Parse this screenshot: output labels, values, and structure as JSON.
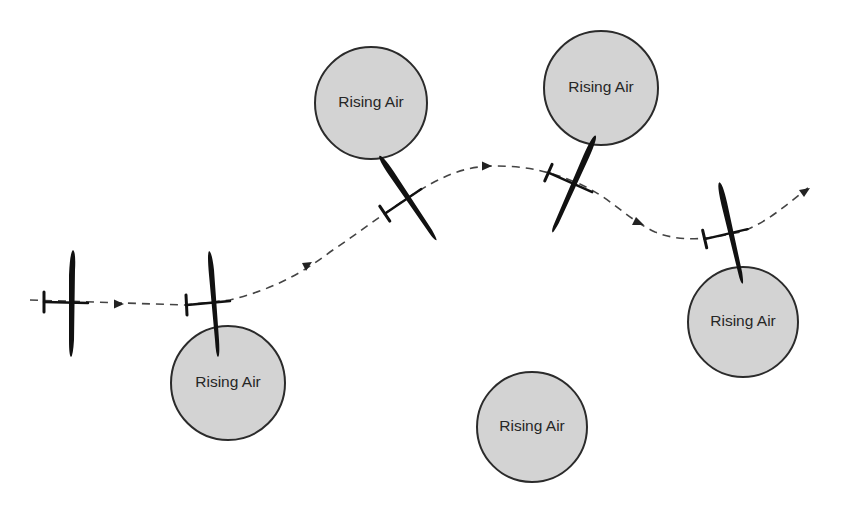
{
  "diagram": {
    "thermals": [
      {
        "label": "Rising Air",
        "cx": 228,
        "cy": 383,
        "r": 57
      },
      {
        "label": "Rising Air",
        "cx": 371,
        "cy": 103,
        "r": 56
      },
      {
        "label": "Rising Air",
        "cx": 601,
        "cy": 88,
        "r": 57
      },
      {
        "label": "Rising Air",
        "cx": 532,
        "cy": 427,
        "r": 55
      },
      {
        "label": "Rising Air",
        "cx": 743,
        "cy": 322,
        "r": 55
      }
    ],
    "flight_path": {
      "style": "dashed",
      "direction": "left-to-right",
      "arrows": 5
    },
    "gliders": [
      {
        "position": 1,
        "heading_deg": 0
      },
      {
        "position": 2,
        "heading_deg": -5
      },
      {
        "position": 3,
        "heading_deg": -32
      },
      {
        "position": 4,
        "heading_deg": 24
      },
      {
        "position": 5,
        "heading_deg": -13
      }
    ],
    "colors": {
      "thermal_fill": "#d3d3d3",
      "outline": "#2b2b2b",
      "glider": "#111111",
      "path": "#444444"
    }
  }
}
